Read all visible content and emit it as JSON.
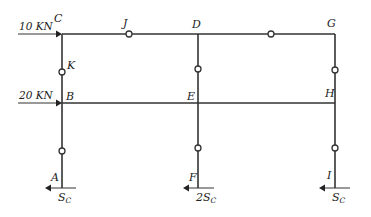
{
  "diagram": {
    "type": "two-story three-column frame with hinges",
    "loads": {
      "top": {
        "label": "10 KN",
        "joint": "C"
      },
      "middle": {
        "label": "20 KN",
        "joint": "B"
      }
    },
    "joints": {
      "C": "C",
      "J": "J",
      "D": "D",
      "G": "G",
      "K": "K",
      "B": "B",
      "E": "E",
      "H": "H",
      "A": "A",
      "F": "F",
      "I": "I"
    },
    "reactions": {
      "A": {
        "coef": "",
        "symbol": "S",
        "subscript": "C"
      },
      "F": {
        "coef": "2",
        "symbol": "S",
        "subscript": "C"
      },
      "I": {
        "coef": "",
        "symbol": "S",
        "subscript": "C"
      }
    },
    "colors": {
      "line": "#333333",
      "background": "#ffffff"
    }
  }
}
